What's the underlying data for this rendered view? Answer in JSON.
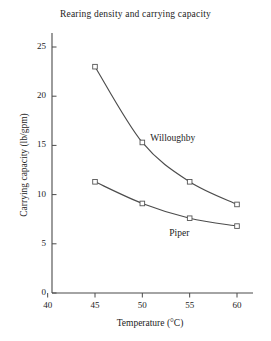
{
  "chart_data": {
    "type": "line",
    "title": "Rearing density and carrying capacity",
    "xlabel": "Temperature (°C)",
    "ylabel": "Carrying capacity (lb/gpm)",
    "x": [
      45,
      50,
      55,
      60
    ],
    "xlim": [
      40,
      61
    ],
    "ylim": [
      0,
      26
    ],
    "xticks": [
      40,
      45,
      50,
      55,
      60
    ],
    "yticks": [
      0,
      5,
      10,
      15,
      20,
      25
    ],
    "xtick_labels": [
      "40",
      "45",
      "50",
      "55",
      "60"
    ],
    "ytick_labels": [
      "0",
      "5",
      "10",
      "15",
      "20",
      "25"
    ],
    "grid": false,
    "legend_position": "inline-annotation",
    "marker": "open-square",
    "line_color": "#4c4c4c",
    "marker_edge_color": "#555555",
    "marker_face_color": "#ffffff",
    "axis_color": "#4a4a4a",
    "series": [
      {
        "name": "Willoughby",
        "values": [
          23.0,
          15.3,
          11.3,
          9.0
        ],
        "label_x": 50,
        "label_y": 15.6
      },
      {
        "name": "Piper",
        "values": [
          11.3,
          9.1,
          7.6,
          6.8
        ],
        "label_x": 52,
        "label_y": 6.0
      }
    ]
  }
}
